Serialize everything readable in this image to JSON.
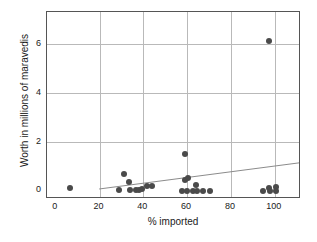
{
  "chart_data": {
    "type": "scatter",
    "title": "",
    "xlabel": "% imported",
    "ylabel": "Worth in millions of maravedis",
    "xlim": [
      -4,
      112
    ],
    "ylim": [
      -0.35,
      7.3
    ],
    "xticks": [
      0,
      20,
      40,
      60,
      80,
      100
    ],
    "yticks": [
      0,
      2,
      4,
      6
    ],
    "grid": true,
    "legend": false,
    "point_color": "#4a4a4a",
    "trendline_color": "#8a8a8a",
    "frame_color": "#555555",
    "gridline_color": "#b9b9b9",
    "points": [
      {
        "x": 6.5,
        "y": 0.09
      },
      {
        "x": 29.0,
        "y": 0.0
      },
      {
        "x": 31.0,
        "y": 0.68
      },
      {
        "x": 33.5,
        "y": 0.35
      },
      {
        "x": 34.0,
        "y": 0.03
      },
      {
        "x": 36.5,
        "y": 0.03
      },
      {
        "x": 38.0,
        "y": 0.03
      },
      {
        "x": 39.5,
        "y": 0.07
      },
      {
        "x": 41.5,
        "y": 0.17
      },
      {
        "x": 44.0,
        "y": 0.17
      },
      {
        "x": 57.5,
        "y": -0.03
      },
      {
        "x": 59.0,
        "y": 1.5
      },
      {
        "x": 59.0,
        "y": 0.42
      },
      {
        "x": 60.5,
        "y": 0.53
      },
      {
        "x": 60.0,
        "y": -0.03
      },
      {
        "x": 62.5,
        "y": -0.03
      },
      {
        "x": 64.0,
        "y": 0.22
      },
      {
        "x": 64.5,
        "y": -0.03
      },
      {
        "x": 67.0,
        "y": -0.03
      },
      {
        "x": 70.5,
        "y": -0.03
      },
      {
        "x": 94.5,
        "y": -0.03
      },
      {
        "x": 97.5,
        "y": 6.13
      },
      {
        "x": 97.5,
        "y": 0.1
      },
      {
        "x": 98.0,
        "y": -0.03
      },
      {
        "x": 100.5,
        "y": 0.15
      },
      {
        "x": 100.5,
        "y": -0.03
      }
    ],
    "trendline": {
      "x_start": 20.0,
      "y_start": -0.02,
      "x_end": 112.0,
      "y_end": 1.06
    }
  }
}
